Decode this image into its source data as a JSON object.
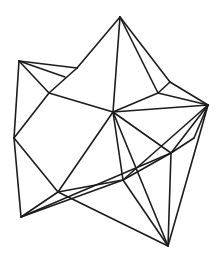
{
  "figure": {
    "background_color": "#ffffff",
    "stroke_color": "#1c1c1c",
    "stroke_width": 1.6,
    "width": 222,
    "height": 257
  },
  "chart_data": {
    "type": "line",
    "title": "",
    "vertices": {
      "A_top_apex": [
        120,
        17
      ],
      "B_upper_left_apex": [
        19,
        61
      ],
      "C_right_apex": [
        208,
        105
      ],
      "D_left_mid": [
        14,
        138
      ],
      "E_lower_left_apex": [
        21,
        217
      ],
      "F_bottom_apex": [
        168,
        246
      ],
      "G_center": [
        113,
        112
      ],
      "H_upper_left_inner": [
        49,
        93
      ],
      "I_topleft_bend": [
        77,
        68
      ],
      "X_sliver_point": [
        65,
        77
      ],
      "J_right_inner": [
        158,
        93
      ],
      "P_right_bend": [
        170,
        82
      ],
      "K_lower_right_inner": [
        171,
        153
      ],
      "N_right_sliver": [
        194,
        138
      ],
      "L_bottom_inner": [
        123,
        180
      ],
      "M_lower_left_inner": [
        58,
        192
      ]
    },
    "edges": [
      [
        "A_top_apex",
        "I_topleft_bend"
      ],
      [
        "A_top_apex",
        "P_right_bend"
      ],
      [
        "A_top_apex",
        "G_center"
      ],
      [
        "A_top_apex",
        "J_right_inner"
      ],
      [
        "B_upper_left_apex",
        "I_topleft_bend"
      ],
      [
        "B_upper_left_apex",
        "X_sliver_point"
      ],
      [
        "B_upper_left_apex",
        "H_upper_left_inner"
      ],
      [
        "B_upper_left_apex",
        "D_left_mid"
      ],
      [
        "I_topleft_bend",
        "H_upper_left_inner"
      ],
      [
        "H_upper_left_inner",
        "G_center"
      ],
      [
        "H_upper_left_inner",
        "D_left_mid"
      ],
      [
        "D_left_mid",
        "M_lower_left_inner"
      ],
      [
        "D_left_mid",
        "E_lower_left_apex"
      ],
      [
        "E_lower_left_apex",
        "M_lower_left_inner"
      ],
      [
        "E_lower_left_apex",
        "L_bottom_inner"
      ],
      [
        "E_lower_left_apex",
        "K_lower_right_inner"
      ],
      [
        "M_lower_left_inner",
        "G_center"
      ],
      [
        "M_lower_left_inner",
        "L_bottom_inner"
      ],
      [
        "M_lower_left_inner",
        "F_bottom_apex"
      ],
      [
        "L_bottom_inner",
        "G_center"
      ],
      [
        "L_bottom_inner",
        "K_lower_right_inner"
      ],
      [
        "L_bottom_inner",
        "F_bottom_apex"
      ],
      [
        "L_bottom_inner",
        "C_right_apex"
      ],
      [
        "K_lower_right_inner",
        "G_center"
      ],
      [
        "K_lower_right_inner",
        "F_bottom_apex"
      ],
      [
        "K_lower_right_inner",
        "C_right_apex"
      ],
      [
        "K_lower_right_inner",
        "N_right_sliver"
      ],
      [
        "N_right_sliver",
        "C_right_apex"
      ],
      [
        "F_bottom_apex",
        "G_center"
      ],
      [
        "F_bottom_apex",
        "C_right_apex"
      ],
      [
        "G_center",
        "J_right_inner"
      ],
      [
        "G_center",
        "C_right_apex"
      ],
      [
        "J_right_inner",
        "P_right_bend"
      ],
      [
        "J_right_inner",
        "C_right_apex"
      ],
      [
        "P_right_bend",
        "C_right_apex"
      ]
    ]
  }
}
